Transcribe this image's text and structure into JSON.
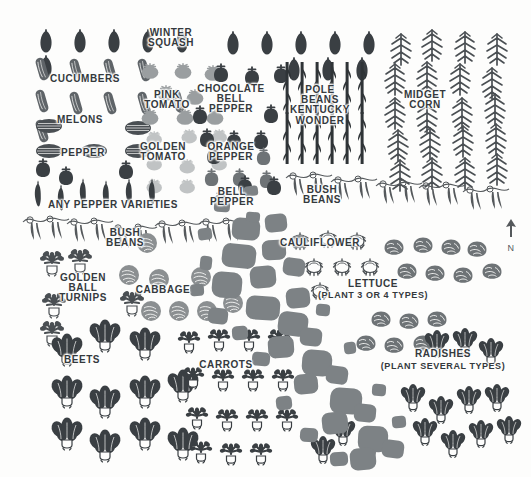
{
  "plan": {
    "title": "Vegetable Garden Plan",
    "background_color": "#fdfdfc",
    "ink_dark": "#3a3f43",
    "ink_mid": "#6e7376",
    "ink_light": "#b9bcbd",
    "path_color": "#7d8285",
    "label_color": "#34393d"
  },
  "compass": {
    "direction_label": "N",
    "arrow": "north-arrow"
  },
  "labels": [
    {
      "id": "winter-squash",
      "text": "WINTER\nSQUASH",
      "x": 171,
      "y": 38,
      "size": "sz-10"
    },
    {
      "id": "cucumbers",
      "text": "CUCUMBERS",
      "x": 85,
      "y": 79,
      "size": "sz-10"
    },
    {
      "id": "pink-tomato",
      "text": "PINK\nTOMATO",
      "x": 167,
      "y": 100,
      "size": "sz-10"
    },
    {
      "id": "chocolate-bell-pepper",
      "text": "CHOCOLATE\nBELL\nPEPPER",
      "x": 231,
      "y": 99,
      "size": "sz-10"
    },
    {
      "id": "pole-beans-kentucky-wonder",
      "text": "POLE\nBEANS\nKENTUCKY\nWONDER",
      "x": 320,
      "y": 105,
      "size": "sz-10"
    },
    {
      "id": "midget-corn",
      "text": "MIDGET\nCORN",
      "x": 425,
      "y": 100,
      "size": "sz-10"
    },
    {
      "id": "melons",
      "text": "MELONS",
      "x": 80,
      "y": 120,
      "size": "sz-10"
    },
    {
      "id": "pepper",
      "text": "PEPPER",
      "x": 83,
      "y": 153,
      "size": "sz-10"
    },
    {
      "id": "golden-tomato",
      "text": "GOLDEN\nTOMATO",
      "x": 163,
      "y": 152,
      "size": "sz-10"
    },
    {
      "id": "orange-pepper",
      "text": "ORANGE\nPEPPER",
      "x": 231,
      "y": 152,
      "size": "sz-10"
    },
    {
      "id": "any-pepper-varieties",
      "text": "ANY PEPPER VARIETIES",
      "x": 113,
      "y": 205,
      "size": "sz-10"
    },
    {
      "id": "bell-pepper",
      "text": "BELL\nPEPPER",
      "x": 232,
      "y": 197,
      "size": "sz-10"
    },
    {
      "id": "bush-beans-upper",
      "text": "BUSH\nBEANS",
      "x": 322,
      "y": 195,
      "size": "sz-10"
    },
    {
      "id": "bush-beans-lower",
      "text": "BUSH\nBEANS",
      "x": 125,
      "y": 238,
      "size": "sz-10"
    },
    {
      "id": "cauliflower",
      "text": "CAULIFLOWER",
      "x": 320,
      "y": 243,
      "size": "sz-10"
    },
    {
      "id": "golden-ball-turnips",
      "text": "GOLDEN\nBALL\nTURNIPS",
      "x": 83,
      "y": 288,
      "size": "sz-10"
    },
    {
      "id": "cabbage",
      "text": "CABBAGE",
      "x": 163,
      "y": 290,
      "size": "sz-10"
    },
    {
      "id": "lettuce",
      "text": "LETTUCE",
      "x": 373,
      "y": 284,
      "size": "sz-10"
    },
    {
      "id": "lettuce-note",
      "text": "(PLANT 3 OR 4 TYPES)",
      "x": 373,
      "y": 296,
      "size": "sz-9"
    },
    {
      "id": "beets",
      "text": "BEETS",
      "x": 82,
      "y": 360,
      "size": "sz-10"
    },
    {
      "id": "carrots",
      "text": "CARROTS",
      "x": 226,
      "y": 365,
      "size": "sz-10"
    },
    {
      "id": "radishes",
      "text": "RADISHES",
      "x": 443,
      "y": 354,
      "size": "sz-10"
    },
    {
      "id": "radishes-note",
      "text": "(PLANT SEVERAL TYPES)",
      "x": 443,
      "y": 367,
      "size": "sz-9"
    }
  ],
  "crops": [
    {
      "id": "winter-squash",
      "icon": "squash-icon",
      "color": "#3a3f43",
      "scale": 1.0,
      "positions": [
        [
          38,
          28
        ],
        [
          72,
          28
        ],
        [
          106,
          28
        ],
        [
          140,
          28
        ],
        [
          174,
          28
        ],
        [
          225,
          30
        ],
        [
          259,
          30
        ],
        [
          293,
          30
        ],
        [
          327,
          30
        ],
        [
          361,
          30
        ],
        [
          38,
          54
        ],
        [
          286,
          56
        ],
        [
          320,
          56
        ],
        [
          354,
          56
        ]
      ]
    },
    {
      "id": "cucumbers",
      "icon": "cucumber-icon",
      "color": "#5f6468",
      "scale": 1.0,
      "positions": [
        [
          35,
          56
        ],
        [
          69,
          57
        ],
        [
          103,
          57
        ],
        [
          137,
          57
        ],
        [
          35,
          88
        ],
        [
          69,
          90
        ],
        [
          103,
          90
        ],
        [
          137,
          90
        ],
        [
          171,
          88
        ],
        [
          35,
          118
        ]
      ]
    },
    {
      "id": "melons",
      "icon": "melon-icon",
      "color": "#4a4f53",
      "scale": 1.0,
      "positions": [
        [
          35,
          118
        ],
        [
          124,
          120
        ],
        [
          35,
          143
        ],
        [
          80,
          143
        ],
        [
          124,
          143
        ]
      ]
    },
    {
      "id": "pink-tomato",
      "icon": "tomato-icon",
      "color": "#9a9ea0",
      "scale": 1.0,
      "positions": [
        [
          140,
          62
        ],
        [
          173,
          62
        ],
        [
          203,
          64
        ],
        [
          156,
          84
        ],
        [
          185,
          88
        ],
        [
          140,
          108
        ],
        [
          175,
          108
        ],
        [
          205,
          108
        ]
      ]
    },
    {
      "id": "golden-tomato",
      "icon": "tomato-icon",
      "color": "#c0c3c4",
      "scale": 0.92,
      "positions": [
        [
          145,
          130
        ],
        [
          180,
          128
        ],
        [
          210,
          128
        ],
        [
          145,
          155
        ],
        [
          178,
          158
        ],
        [
          210,
          155
        ],
        [
          145,
          178
        ],
        [
          178,
          178
        ]
      ]
    },
    {
      "id": "chocolate-bell-pepper",
      "icon": "bell-pepper-icon",
      "color": "#3a3f43",
      "scale": 1.0,
      "positions": [
        [
          212,
          63
        ],
        [
          243,
          66
        ],
        [
          272,
          64
        ],
        [
          191,
          105
        ],
        [
          262,
          104
        ],
        [
          198,
          128
        ],
        [
          225,
          130
        ],
        [
          252,
          130
        ]
      ]
    },
    {
      "id": "orange-pepper",
      "icon": "bell-pepper-icon",
      "color": "#6e7376",
      "scale": 0.95,
      "positions": [
        [
          255,
          147
        ],
        [
          203,
          168
        ],
        [
          231,
          168
        ],
        [
          258,
          170
        ],
        [
          212,
          190
        ]
      ]
    },
    {
      "id": "bell-pepper-cluster",
      "icon": "bell-pepper-icon",
      "color": "#3a3f43",
      "scale": 1.0,
      "positions": [
        [
          34,
          158
        ],
        [
          57,
          166
        ],
        [
          117,
          160
        ],
        [
          205,
          145
        ],
        [
          236,
          175
        ],
        [
          265,
          176
        ]
      ]
    },
    {
      "id": "pepper-hot",
      "icon": "chili-icon",
      "color": "#3a3f43",
      "scale": 1.0,
      "positions": [
        [
          32,
          178
        ],
        [
          55,
          182
        ],
        [
          77,
          176
        ],
        [
          100,
          178
        ],
        [
          123,
          176
        ],
        [
          146,
          176
        ]
      ]
    },
    {
      "id": "pole-beans",
      "icon": "pole-bean-icon",
      "color": "#2f3437",
      "scale": 1.0,
      "positions": [
        [
          280,
          62
        ],
        [
          295,
          62
        ],
        [
          310,
          62
        ],
        [
          325,
          62
        ],
        [
          340,
          62
        ],
        [
          355,
          62
        ],
        [
          280,
          112
        ],
        [
          295,
          112
        ],
        [
          310,
          112
        ],
        [
          325,
          112
        ],
        [
          340,
          112
        ],
        [
          355,
          112
        ]
      ]
    },
    {
      "id": "midget-corn",
      "icon": "corn-icon",
      "color": "#4a4f53",
      "scale": 1.0,
      "positions": [
        [
          388,
          32
        ],
        [
          419,
          28
        ],
        [
          452,
          30
        ],
        [
          484,
          32
        ],
        [
          382,
          62
        ],
        [
          414,
          60
        ],
        [
          447,
          62
        ],
        [
          479,
          66
        ],
        [
          382,
          96
        ],
        [
          414,
          100
        ],
        [
          449,
          96
        ],
        [
          482,
          92
        ],
        [
          385,
          128
        ],
        [
          417,
          126
        ],
        [
          450,
          124
        ],
        [
          483,
          122
        ],
        [
          387,
          158
        ],
        [
          419,
          156
        ],
        [
          452,
          156
        ],
        [
          484,
          152
        ]
      ]
    },
    {
      "id": "bush-beans-vine-upper",
      "icon": "bean-vine-icon",
      "color": "#55595c",
      "scale": 1.0,
      "positions": [
        [
          285,
          168
        ],
        [
          330,
          172
        ],
        [
          375,
          176
        ],
        [
          418,
          178
        ],
        [
          462,
          182
        ]
      ]
    },
    {
      "id": "bush-beans-vine-lower",
      "icon": "bean-vine-icon",
      "color": "#55595c",
      "scale": 1.0,
      "positions": [
        [
          22,
          212
        ],
        [
          66,
          214
        ],
        [
          110,
          220
        ],
        [
          154,
          216
        ],
        [
          198,
          214
        ]
      ]
    },
    {
      "id": "cauliflower",
      "icon": "cauliflower-icon",
      "color": "#4a4f53",
      "scale": 1.0,
      "positions": [
        [
          290,
          232
        ],
        [
          318,
          230
        ],
        [
          347,
          232
        ],
        [
          304,
          258
        ],
        [
          332,
          258
        ],
        [
          360,
          258
        ],
        [
          310,
          282
        ]
      ]
    },
    {
      "id": "cabbage",
      "icon": "cabbage-icon",
      "color": "#8b8f91",
      "scale": 1.0,
      "positions": [
        [
          118,
          264
        ],
        [
          148,
          268
        ],
        [
          190,
          266
        ],
        [
          140,
          300
        ],
        [
          168,
          300
        ],
        [
          196,
          300
        ],
        [
          222,
          292
        ],
        [
          136,
          232
        ]
      ]
    },
    {
      "id": "lettuce",
      "icon": "lettuce-icon",
      "color": "#6e7376",
      "scale": 1.0,
      "positions": [
        [
          383,
          238
        ],
        [
          412,
          236
        ],
        [
          440,
          238
        ],
        [
          466,
          240
        ],
        [
          396,
          262
        ],
        [
          424,
          264
        ],
        [
          452,
          266
        ],
        [
          481,
          262
        ],
        [
          370,
          310
        ],
        [
          398,
          312
        ],
        [
          426,
          310
        ],
        [
          355,
          334
        ],
        [
          383,
          336
        ],
        [
          412,
          334
        ]
      ]
    },
    {
      "id": "golden-ball-turnips",
      "icon": "turnip-icon",
      "color": "#4a4f53",
      "scale": 1.0,
      "positions": [
        [
          40,
          250
        ],
        [
          68,
          248
        ],
        [
          42,
          292
        ],
        [
          120,
          290
        ],
        [
          40,
          320
        ]
      ]
    },
    {
      "id": "beets",
      "icon": "beet-icon",
      "color": "#3a3f43",
      "scale": 1.0,
      "positions": [
        [
          50,
          336
        ],
        [
          88,
          322
        ],
        [
          128,
          330
        ],
        [
          50,
          378
        ],
        [
          88,
          388
        ],
        [
          128,
          378
        ],
        [
          166,
          372
        ],
        [
          50,
          420
        ],
        [
          88,
          432
        ],
        [
          128,
          420
        ],
        [
          166,
          430
        ]
      ]
    },
    {
      "id": "carrots",
      "icon": "carrot-top-icon",
      "color": "#3a3f43",
      "scale": 1.0,
      "positions": [
        [
          178,
          330
        ],
        [
          208,
          328
        ],
        [
          238,
          328
        ],
        [
          268,
          328
        ],
        [
          182,
          366
        ],
        [
          212,
          368
        ],
        [
          242,
          368
        ],
        [
          272,
          368
        ],
        [
          186,
          406
        ],
        [
          216,
          408
        ],
        [
          246,
          408
        ],
        [
          276,
          408
        ],
        [
          190,
          440
        ],
        [
          220,
          442
        ],
        [
          250,
          442
        ]
      ]
    },
    {
      "id": "radishes",
      "icon": "radish-icon",
      "color": "#3a3f43",
      "scale": 1.0,
      "positions": [
        [
          424,
          332
        ],
        [
          452,
          330
        ],
        [
          478,
          340
        ],
        [
          400,
          386
        ],
        [
          428,
          398
        ],
        [
          456,
          388
        ],
        [
          484,
          386
        ],
        [
          412,
          420
        ],
        [
          440,
          432
        ],
        [
          468,
          422
        ],
        [
          496,
          418
        ],
        [
          330,
          420
        ],
        [
          358,
          432
        ],
        [
          310,
          438
        ]
      ]
    }
  ],
  "path": {
    "name": "garden-stone-path",
    "color": "#7d8285",
    "stones": [
      [
        232,
        218,
        28,
        22,
        4
      ],
      [
        265,
        214,
        22,
        18,
        -6
      ],
      [
        222,
        244,
        34,
        24,
        6
      ],
      [
        262,
        240,
        24,
        20,
        -3
      ],
      [
        212,
        272,
        30,
        26,
        5
      ],
      [
        250,
        266,
        26,
        22,
        -5
      ],
      [
        283,
        258,
        22,
        18,
        8
      ],
      [
        246,
        296,
        34,
        24,
        4
      ],
      [
        286,
        288,
        24,
        20,
        -6
      ],
      [
        278,
        312,
        30,
        24,
        7
      ],
      [
        268,
        336,
        26,
        22,
        -4
      ],
      [
        300,
        328,
        22,
        18,
        6
      ],
      [
        302,
        350,
        30,
        26,
        4
      ],
      [
        294,
        374,
        24,
        20,
        -5
      ],
      [
        326,
        366,
        22,
        18,
        8
      ],
      [
        330,
        388,
        32,
        26,
        4
      ],
      [
        322,
        412,
        26,
        22,
        -6
      ],
      [
        354,
        404,
        22,
        18,
        5
      ],
      [
        358,
        426,
        30,
        26,
        3
      ],
      [
        350,
        448,
        26,
        22,
        -5
      ],
      [
        382,
        440,
        22,
        18,
        7
      ],
      [
        198,
        228,
        14,
        12,
        -8
      ],
      [
        200,
        256,
        12,
        14,
        6
      ],
      [
        190,
        284,
        14,
        12,
        -4
      ],
      [
        246,
        212,
        14,
        10,
        4
      ],
      [
        292,
        236,
        14,
        12,
        -6
      ],
      [
        316,
        304,
        14,
        12,
        5
      ],
      [
        344,
        342,
        12,
        12,
        -6
      ],
      [
        372,
        384,
        14,
        12,
        4
      ],
      [
        392,
        416,
        14,
        12,
        -5
      ],
      [
        208,
        308,
        20,
        16,
        6
      ],
      [
        232,
        326,
        16,
        14,
        -4
      ],
      [
        252,
        352,
        18,
        14,
        5
      ],
      [
        276,
        396,
        16,
        14,
        -6
      ],
      [
        300,
        428,
        18,
        14,
        4
      ],
      [
        330,
        452,
        18,
        14,
        -4
      ],
      [
        214,
        200,
        16,
        12,
        5
      ],
      [
        244,
        186,
        14,
        10,
        -7
      ]
    ]
  }
}
